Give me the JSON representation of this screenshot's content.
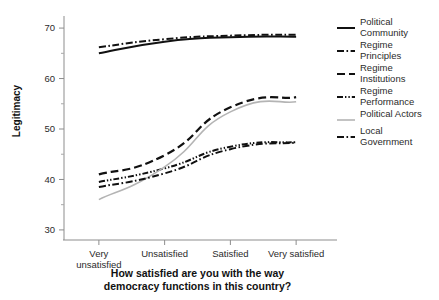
{
  "chart_data": {
    "type": "line",
    "title": "",
    "xlabel": "How satisfied are you with the way democracy functions in this country?",
    "ylabel": "Legitimacy",
    "categories": [
      "Very unsatisfied",
      "Unsatisfied",
      "Satisfied",
      "Very satisfied"
    ],
    "ylim": [
      28,
      72
    ],
    "yticks": [
      30,
      40,
      50,
      60,
      70
    ],
    "ytick_labels": [
      "30",
      "40",
      "50",
      "60",
      "70"
    ],
    "yminorticks": [
      35,
      45,
      55,
      65
    ],
    "grid": false,
    "legend_position": "right",
    "series": [
      {
        "name": "Political Community",
        "values": [
          65.0,
          67.3,
          68.2,
          68.3
        ],
        "color": "#111111",
        "style": "solid",
        "dasharray": "",
        "width": 2.0
      },
      {
        "name": "Regime Principles",
        "values": [
          66.2,
          67.8,
          68.5,
          68.7
        ],
        "color": "#111111",
        "style": "dash-dot",
        "dasharray": "7 2.5 1.6 2.5",
        "width": 2.0
      },
      {
        "name": "Regime Institutions",
        "values": [
          41.0,
          44.8,
          54.3,
          56.3
        ],
        "color": "#111111",
        "style": "dashed",
        "dasharray": "8 4",
        "width": 2.2
      },
      {
        "name": "Regime Performance",
        "values": [
          39.5,
          42.2,
          46.5,
          47.4
        ],
        "color": "#111111",
        "style": "dash-dot-dot",
        "dasharray": "6 2 1.4 2 1.4 2",
        "width": 2.0
      },
      {
        "name": "Political Actors",
        "values": [
          36.0,
          42.5,
          53.4,
          55.4
        ],
        "color": "#b4b4b4",
        "style": "solid",
        "dasharray": "",
        "width": 1.6
      },
      {
        "name": "Local Government",
        "values": [
          38.5,
          41.2,
          46.0,
          47.3
        ],
        "color": "#111111",
        "style": "dash-dot",
        "dasharray": "7 2.5 1.6 2.5",
        "width": 2.0
      }
    ]
  },
  "xaxis_title_lines": [
    "How satisfied are you with the way",
    "democracy functions in this country?"
  ],
  "legend": {
    "items": [
      {
        "label_lines": [
          "Political",
          "Community"
        ]
      },
      {
        "label_lines": [
          "Regime",
          "Principles"
        ]
      },
      {
        "label_lines": [
          "Regime",
          "Institutions"
        ]
      },
      {
        "label_lines": [
          "Regime",
          "Performance"
        ]
      },
      {
        "label_lines": [
          "Political Actors"
        ]
      },
      {
        "label_lines": [
          "Local",
          "Government"
        ]
      }
    ]
  }
}
